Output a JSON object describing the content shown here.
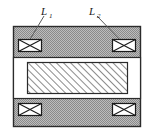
{
  "figure": {
    "type": "cross-section-diagram",
    "background_color": "#ffffff"
  },
  "labels": [
    {
      "id": "L1",
      "base": "L",
      "subscript": "1",
      "x": 47,
      "y": 13,
      "leader_from": [
        44,
        16
      ],
      "leader_to": [
        29,
        41
      ],
      "points_to": "winding-top-left"
    },
    {
      "id": "L2",
      "base": "L",
      "subscript": "2",
      "x": 95,
      "y": 13,
      "leader_from": [
        97,
        16
      ],
      "leader_to": [
        125,
        45
      ],
      "points_to": "winding-top-right"
    }
  ],
  "outer_body": {
    "name": "yoke-body",
    "x": 13,
    "y": 26,
    "width": 128,
    "height": 101,
    "fill_color": "#a8a8a8",
    "texture": "stipple",
    "border_color": "#2b2b2b",
    "border_width": 1.4
  },
  "window_band": {
    "name": "air-gap-window",
    "x": 13,
    "y": 57,
    "width": 128,
    "height": 42,
    "fill_color": "#ffffff",
    "border_color": "#2b2b2b"
  },
  "core": {
    "name": "laminated-core",
    "x": 27,
    "y": 62,
    "width": 101,
    "height": 32,
    "fill_color": "#ffffff",
    "hatch_color": "#6e6e6e",
    "hatch_angle_deg": 45,
    "border_color": "#2b2b2b"
  },
  "windings": [
    {
      "id": "winding-top-left",
      "x": 18,
      "y": 39,
      "width": 24,
      "height": 13
    },
    {
      "id": "winding-top-right",
      "x": 112,
      "y": 39,
      "width": 24,
      "height": 13
    },
    {
      "id": "winding-bottom-left",
      "x": 18,
      "y": 103,
      "width": 24,
      "height": 13
    },
    {
      "id": "winding-bottom-right",
      "x": 112,
      "y": 103,
      "width": 24,
      "height": 13
    }
  ],
  "winding_style": {
    "symbol": "bowtie-cross",
    "fill_color": "#ffffff",
    "border_color": "#1a1a1a",
    "cross_color": "#1a1a1a"
  },
  "leader_line_color": "#5a5a5a"
}
